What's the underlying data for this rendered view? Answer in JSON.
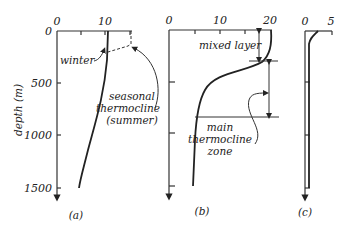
{
  "figure": {
    "y_axis_label": "depth (m)",
    "y_ticks": [
      "0",
      "500",
      "1000",
      "1500"
    ],
    "panels": [
      {
        "id": "a",
        "caption": "(a)",
        "x_ticks": [
          "0",
          "10"
        ],
        "annotations": {
          "winter": "winter",
          "seasonal_line1": "seasonal",
          "seasonal_line2": "thermocline",
          "seasonal_line3": "(summer)"
        }
      },
      {
        "id": "b",
        "caption": "(b)",
        "x_ticks": [
          "0",
          "10",
          "20"
        ],
        "annotations": {
          "mixed_layer": "mixed layer",
          "main_line1": "main",
          "main_line2": "thermocline",
          "main_line3": "zone"
        }
      },
      {
        "id": "c",
        "caption": "(c)",
        "x_ticks": [
          "0",
          "5"
        ]
      }
    ]
  }
}
